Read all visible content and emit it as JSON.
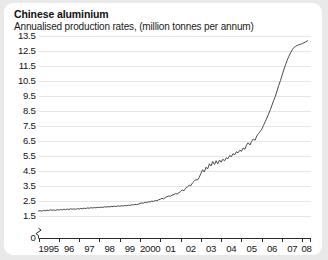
{
  "card": {
    "title": "Chinese aluminium",
    "subtitle": "Annualised production rates, (million tonnes per annum)",
    "background_color": "#ffffff",
    "page_background_color": "#e9e9ea"
  },
  "chart_data": {
    "type": "line",
    "title": "Chinese aluminium",
    "subtitle": "Annualised production rates, (million tonnes per annum)",
    "xlabel": "",
    "ylabel": "million tonnes per annum",
    "grid": true,
    "legend": false,
    "line_color": "#4a4a4a",
    "grid_color": "#e6e6e6",
    "axis_color": "#2b2b2b",
    "axis_break": true,
    "axis_break_note": "y-axis broken between 0 and 1.5",
    "ylim": [
      1.5,
      13.5
    ],
    "y_baseline_label": "0",
    "ytick_labels": [
      "13.5",
      "12.5",
      "11.5",
      "10.5",
      "9.5",
      "8.5",
      "7.5",
      "6.5",
      "5.5",
      "4.5",
      "3.5",
      "2.5",
      "1.5",
      "0"
    ],
    "yticks": [
      13.5,
      12.5,
      11.5,
      10.5,
      9.5,
      8.5,
      7.5,
      6.5,
      5.5,
      4.5,
      3.5,
      2.5,
      1.5
    ],
    "xtick_labels": [
      "1995",
      "96",
      "97",
      "98",
      "99",
      "2000",
      "01",
      "02",
      "03",
      "04",
      "05",
      "06",
      "07",
      "08"
    ],
    "xticks": [
      1995,
      1996,
      1997,
      1998,
      1999,
      2000,
      2001,
      2002,
      2003,
      2004,
      2005,
      2006,
      2007,
      2008
    ],
    "xlim": [
      1995.0,
      2008.4
    ],
    "x": [
      1995.0,
      1995.08,
      1995.17,
      1995.25,
      1995.33,
      1995.42,
      1995.5,
      1995.58,
      1995.67,
      1995.75,
      1995.83,
      1995.92,
      1996.0,
      1996.08,
      1996.17,
      1996.25,
      1996.33,
      1996.42,
      1996.5,
      1996.58,
      1996.67,
      1996.75,
      1996.83,
      1996.92,
      1997.0,
      1997.08,
      1997.17,
      1997.25,
      1997.33,
      1997.42,
      1997.5,
      1997.58,
      1997.67,
      1997.75,
      1997.83,
      1997.92,
      1998.0,
      1998.08,
      1998.17,
      1998.25,
      1998.33,
      1998.42,
      1998.5,
      1998.58,
      1998.67,
      1998.75,
      1998.83,
      1998.92,
      1999.0,
      1999.08,
      1999.17,
      1999.25,
      1999.33,
      1999.42,
      1999.5,
      1999.58,
      1999.67,
      1999.75,
      1999.83,
      1999.92,
      2000.0,
      2000.08,
      2000.17,
      2000.25,
      2000.33,
      2000.42,
      2000.5,
      2000.58,
      2000.67,
      2000.75,
      2000.83,
      2000.92,
      2001.0,
      2001.08,
      2001.17,
      2001.25,
      2001.33,
      2001.42,
      2001.5,
      2001.58,
      2001.67,
      2001.75,
      2001.83,
      2001.92,
      2002.0,
      2002.08,
      2002.17,
      2002.25,
      2002.33,
      2002.42,
      2002.5,
      2002.58,
      2002.67,
      2002.75,
      2002.83,
      2002.92,
      2003.0,
      2003.08,
      2003.17,
      2003.25,
      2003.33,
      2003.42,
      2003.5,
      2003.58,
      2003.67,
      2003.75,
      2003.83,
      2003.92,
      2004.0,
      2004.08,
      2004.17,
      2004.25,
      2004.33,
      2004.42,
      2004.5,
      2004.58,
      2004.67,
      2004.75,
      2004.83,
      2004.92,
      2005.0,
      2005.08,
      2005.17,
      2005.25,
      2005.33,
      2005.42,
      2005.5,
      2005.58,
      2005.67,
      2005.75,
      2005.83,
      2005.92,
      2006.0,
      2006.08,
      2006.17,
      2006.25,
      2006.33,
      2006.42,
      2006.5,
      2006.58,
      2006.67,
      2006.75,
      2006.83,
      2006.92,
      2007.0,
      2007.08,
      2007.17,
      2007.25,
      2007.33,
      2007.42,
      2007.5,
      2007.58,
      2007.67,
      2007.75,
      2007.83,
      2007.92,
      2008.0,
      2008.08,
      2008.17,
      2008.25
    ],
    "y": [
      1.8,
      1.82,
      1.79,
      1.84,
      1.81,
      1.86,
      1.83,
      1.88,
      1.85,
      1.87,
      1.84,
      1.89,
      1.86,
      1.9,
      1.87,
      1.92,
      1.89,
      1.93,
      1.9,
      1.95,
      1.92,
      1.94,
      1.91,
      1.96,
      1.93,
      1.97,
      1.95,
      1.99,
      1.96,
      2.01,
      1.98,
      2.02,
      2.0,
      2.03,
      2.01,
      2.05,
      2.03,
      2.06,
      2.04,
      2.08,
      2.06,
      2.09,
      2.07,
      2.11,
      2.09,
      2.12,
      2.1,
      2.14,
      2.12,
      2.15,
      2.13,
      2.17,
      2.15,
      2.19,
      2.17,
      2.21,
      2.2,
      2.24,
      2.22,
      2.26,
      2.3,
      2.34,
      2.32,
      2.38,
      2.36,
      2.42,
      2.4,
      2.46,
      2.44,
      2.5,
      2.48,
      2.55,
      2.58,
      2.64,
      2.61,
      2.7,
      2.75,
      2.8,
      2.78,
      2.86,
      2.9,
      2.96,
      2.94,
      3.02,
      3.1,
      3.2,
      3.15,
      3.32,
      3.4,
      3.52,
      3.48,
      3.66,
      3.78,
      3.9,
      3.86,
      4.05,
      4.3,
      4.55,
      4.4,
      4.72,
      4.6,
      4.95,
      4.8,
      5.1,
      4.9,
      5.15,
      4.95,
      5.2,
      5.05,
      5.25,
      5.15,
      5.35,
      5.28,
      5.5,
      5.42,
      5.62,
      5.55,
      5.75,
      5.68,
      5.85,
      5.78,
      6.0,
      5.92,
      6.2,
      6.35,
      6.2,
      6.45,
      6.6,
      6.52,
      6.8,
      6.95,
      7.1,
      7.25,
      7.5,
      7.75,
      8.0,
      8.25,
      8.55,
      8.85,
      9.15,
      9.45,
      9.8,
      10.15,
      10.5,
      10.85,
      11.2,
      11.55,
      11.85,
      12.1,
      12.35,
      12.55,
      12.7,
      12.78,
      12.84,
      12.88,
      12.92,
      12.96,
      13.02,
      13.08,
      13.15
    ]
  }
}
